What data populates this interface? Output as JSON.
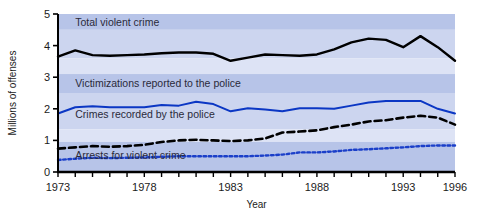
{
  "chart_data": {
    "type": "line",
    "title": "",
    "xlabel": "Year",
    "ylabel": "Millions of offenses",
    "xlim": [
      1973,
      1996
    ],
    "ylim": [
      0,
      5
    ],
    "ytick_labels": [
      "0",
      "1",
      "2",
      "3",
      "4",
      "5"
    ],
    "yticks": [
      0,
      1,
      2,
      3,
      4,
      5
    ],
    "xtick_labels": [
      "1973",
      "1978",
      "1983",
      "1988",
      "1993",
      "1996"
    ],
    "xticks_labeled": [
      1973,
      1978,
      1983,
      1988,
      1993,
      1996
    ],
    "xticks_minor_every": 1,
    "grid": false,
    "legend_position": "inline-annotations",
    "background_bands": [
      {
        "from": 5.0,
        "to": 4.5,
        "color": "#b7c4e8"
      },
      {
        "from": 4.5,
        "to": 3.6,
        "color": "#ccd5ef"
      },
      {
        "from": 3.6,
        "to": 3.1,
        "color": "#dde3f5"
      },
      {
        "from": 3.1,
        "to": 2.5,
        "color": "#b7c4e8"
      },
      {
        "from": 2.5,
        "to": 1.35,
        "color": "#ccd5ef"
      },
      {
        "from": 1.35,
        "to": 0.95,
        "color": "#dde3f5"
      },
      {
        "from": 0.95,
        "to": 0.0,
        "color": "#b7c4e8"
      }
    ],
    "x": [
      1973,
      1974,
      1975,
      1976,
      1977,
      1978,
      1979,
      1980,
      1981,
      1982,
      1983,
      1984,
      1985,
      1986,
      1987,
      1988,
      1989,
      1990,
      1991,
      1992,
      1993,
      1994,
      1995,
      1996
    ],
    "series": [
      {
        "name": "Total violent crime",
        "color": "#000000",
        "style": "solid",
        "label_text": "Total violent crime",
        "values": [
          3.65,
          3.85,
          3.7,
          3.68,
          3.7,
          3.72,
          3.76,
          3.78,
          3.78,
          3.74,
          3.52,
          3.62,
          3.72,
          3.7,
          3.68,
          3.72,
          3.88,
          4.1,
          4.22,
          4.18,
          3.95,
          4.3,
          3.95,
          3.52
        ]
      },
      {
        "name": "Victimizations reported to the police",
        "color": "#0b37c4",
        "style": "solid",
        "label_text": "Victimizations reported to the police",
        "values": [
          1.85,
          2.05,
          2.08,
          2.05,
          2.05,
          2.05,
          2.12,
          2.1,
          2.22,
          2.15,
          1.92,
          2.02,
          1.98,
          1.92,
          2.02,
          2.02,
          2.0,
          2.1,
          2.2,
          2.25,
          2.25,
          2.25,
          2.0,
          1.85
        ]
      },
      {
        "name": "Crimes recorded by the police",
        "color": "#000000",
        "style": "dashed",
        "label_text": "Crimes recorded by the police",
        "values": [
          0.74,
          0.78,
          0.82,
          0.8,
          0.82,
          0.86,
          0.95,
          1.0,
          1.02,
          1.0,
          0.98,
          1.0,
          1.06,
          1.25,
          1.28,
          1.32,
          1.42,
          1.5,
          1.6,
          1.64,
          1.72,
          1.78,
          1.72,
          1.5
        ]
      },
      {
        "name": "Arrests for violent crime",
        "color": "#1b3fc9",
        "style": "dotted",
        "label_text": "Arrests for violent crime",
        "values": [
          0.38,
          0.42,
          0.45,
          0.44,
          0.45,
          0.46,
          0.48,
          0.5,
          0.5,
          0.5,
          0.5,
          0.5,
          0.52,
          0.55,
          0.62,
          0.62,
          0.65,
          0.7,
          0.72,
          0.75,
          0.78,
          0.82,
          0.84,
          0.84
        ]
      }
    ],
    "annotations": [
      {
        "text": "Total violent crime",
        "x": 1974.0,
        "y": 4.62
      },
      {
        "text": "Victimizations reported to the police",
        "x": 1974.0,
        "y": 2.7
      },
      {
        "text": "Crimes recorded by the police",
        "x": 1974.0,
        "y": 1.72
      },
      {
        "text": "Arrests for violent crime",
        "x": 1974.0,
        "y": 0.42
      }
    ]
  }
}
